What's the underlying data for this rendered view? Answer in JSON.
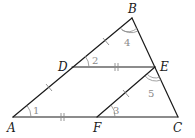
{
  "diagram": {
    "vertices": [
      {
        "name": "A",
        "label": "A"
      },
      {
        "name": "B",
        "label": "B"
      },
      {
        "name": "C",
        "label": "C"
      },
      {
        "name": "D",
        "label": "D"
      },
      {
        "name": "E",
        "label": "E"
      },
      {
        "name": "F",
        "label": "F"
      }
    ],
    "segments": [
      "AB",
      "BC",
      "AC",
      "DE",
      "EF"
    ],
    "angles": [
      {
        "label": "1",
        "vertex": "A"
      },
      {
        "label": "2",
        "vertex": "D"
      },
      {
        "label": "3",
        "vertex": "F"
      },
      {
        "label": "4",
        "vertex": "B"
      },
      {
        "label": "5",
        "vertex": "E"
      }
    ],
    "markings": {
      "single_tick": [
        "AD",
        "DB",
        "FE"
      ],
      "double_tick": [
        "DE",
        "AF"
      ],
      "double_arc": [
        "B",
        "E"
      ]
    },
    "colors": {
      "line": "#1a1a1a",
      "mark": "#8a8a8a"
    }
  }
}
